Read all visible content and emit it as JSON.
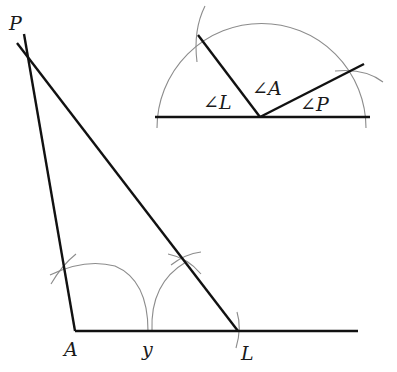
{
  "diagram": {
    "colors": {
      "construction_line": "#111111",
      "compass_arc": "#8c8c8c",
      "background": "#ffffff"
    },
    "main_triangle": {
      "vertices": [
        {
          "id": "P",
          "label": "P",
          "x": 24,
          "y": 48
        },
        {
          "id": "A",
          "label": "A",
          "x": 75,
          "y": 331
        },
        {
          "id": "L",
          "label": "L",
          "x": 238,
          "y": 331
        }
      ],
      "points": [
        {
          "id": "y",
          "label": "y",
          "x": 150,
          "y": 331
        }
      ],
      "baseline": {
        "from": [
          75,
          331
        ],
        "to": [
          358,
          331
        ]
      }
    },
    "inset_angles": {
      "labels": [
        {
          "id": "angle-L",
          "text": "∠L"
        },
        {
          "id": "angle-A",
          "text": "∠A"
        },
        {
          "id": "angle-P",
          "text": "∠P"
        }
      ],
      "vertex": [
        260,
        117
      ],
      "baseline": {
        "from": [
          155,
          117
        ],
        "to": [
          370,
          117
        ]
      }
    }
  }
}
